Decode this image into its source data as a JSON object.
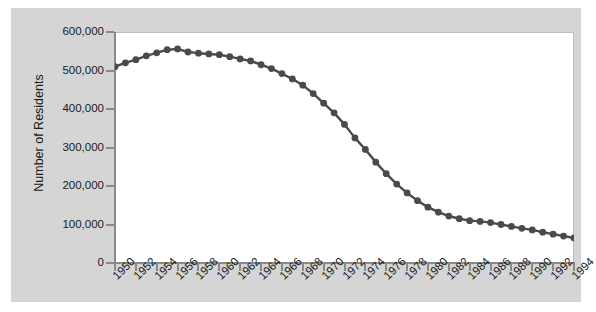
{
  "chart_data": {
    "type": "line",
    "title": "",
    "xlabel": "",
    "ylabel": "Number of Residents",
    "ylim": [
      0,
      600000
    ],
    "xlim": [
      1950,
      1994
    ],
    "grid": false,
    "legend": null,
    "marker": "circle",
    "series_color": "#4a4a4a",
    "ytick_labels": [
      "600,000",
      "500,000",
      "400,000",
      "300,000",
      "200,000",
      "100,000",
      "0"
    ],
    "ytick_values": [
      600000,
      500000,
      400000,
      300000,
      200000,
      100000,
      0
    ],
    "xtick_labels": [
      "1950",
      "1952",
      "1954",
      "1956",
      "1958",
      "1960",
      "1962",
      "1964",
      "1966",
      "1968",
      "1970",
      "1972",
      "1974",
      "1976",
      "1978",
      "1980",
      "1982",
      "1984",
      "1986",
      "1988",
      "1990",
      "1992",
      "1994"
    ],
    "xtick_values": [
      1950,
      1952,
      1954,
      1956,
      1958,
      1960,
      1962,
      1964,
      1966,
      1968,
      1970,
      1972,
      1974,
      1976,
      1978,
      1980,
      1982,
      1984,
      1986,
      1988,
      1990,
      1992,
      1994
    ],
    "x": [
      1950,
      1951,
      1952,
      1953,
      1954,
      1955,
      1956,
      1957,
      1958,
      1959,
      1960,
      1961,
      1962,
      1963,
      1964,
      1965,
      1966,
      1967,
      1968,
      1969,
      1970,
      1971,
      1972,
      1973,
      1974,
      1975,
      1976,
      1977,
      1978,
      1979,
      1980,
      1981,
      1982,
      1983,
      1984,
      1985,
      1986,
      1987,
      1988,
      1989,
      1990,
      1991,
      1992,
      1993,
      1994
    ],
    "values": [
      510000,
      520000,
      528000,
      538000,
      546000,
      554000,
      556000,
      548000,
      545000,
      543000,
      541000,
      536000,
      530000,
      525000,
      515000,
      505000,
      492000,
      478000,
      462000,
      440000,
      415000,
      390000,
      360000,
      325000,
      295000,
      262000,
      232000,
      205000,
      182000,
      162000,
      145000,
      132000,
      122000,
      115000,
      110000,
      108000,
      105000,
      100000,
      95000,
      90000,
      86000,
      80000,
      75000,
      70000,
      65000
    ]
  }
}
